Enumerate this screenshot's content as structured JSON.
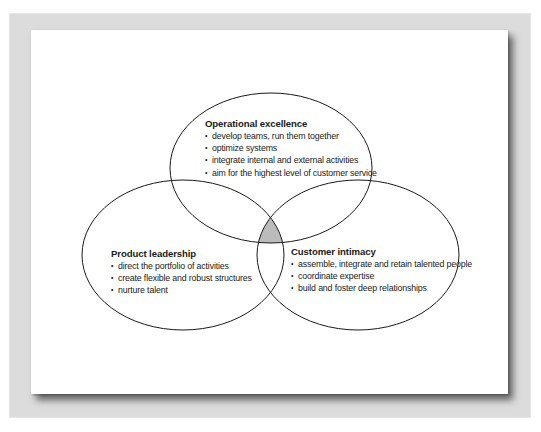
{
  "diagram": {
    "type": "venn",
    "colors": {
      "frame": "#dcdcdc",
      "card": "#ffffff",
      "stroke": "#1a1a1a",
      "intersection_fill": "#bbbbbb"
    },
    "bullet_glyph": "•",
    "sets": [
      {
        "id": "operational",
        "title": "Operational excellence",
        "items": [
          "develop teams, run them together",
          "optimize systems",
          "integrate internal and external activities",
          "aim for the highest level of customer service"
        ]
      },
      {
        "id": "product",
        "title": "Product leadership",
        "items": [
          "direct the portfolio of activities",
          "create flexible and robust structures",
          "nurture talent"
        ]
      },
      {
        "id": "customer",
        "title": "Customer intimacy",
        "items": [
          "assemble, integrate and retain talented people",
          "coordinate expertise",
          "build and foster deep relationships"
        ]
      }
    ]
  }
}
